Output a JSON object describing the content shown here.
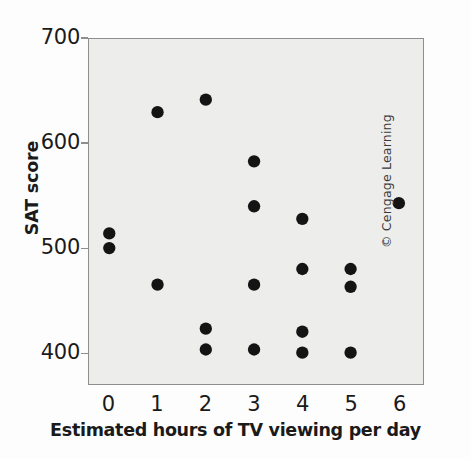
{
  "chart_data": {
    "type": "scatter",
    "title": "",
    "xlabel": "Estimated hours of TV viewing per day",
    "ylabel": "SAT score",
    "xlim": [
      -0.42,
      6.5
    ],
    "ylim": [
      370,
      700
    ],
    "xticks": [
      "0",
      "1",
      "2",
      "3",
      "4",
      "5",
      "6"
    ],
    "xtick_values": [
      0,
      1,
      2,
      3,
      4,
      5,
      6
    ],
    "yticks": [
      "700",
      "600",
      "500",
      "400"
    ],
    "ytick_values": [
      700,
      600,
      500,
      400
    ],
    "grid": false,
    "legend": null,
    "marker": "filled-circle",
    "marker_color": "#141414",
    "panel_color": "#ededeb",
    "points": [
      {
        "x": 0,
        "y": 514
      },
      {
        "x": 0,
        "y": 500
      },
      {
        "x": 1,
        "y": 630
      },
      {
        "x": 1,
        "y": 465
      },
      {
        "x": 2,
        "y": 642
      },
      {
        "x": 2,
        "y": 423
      },
      {
        "x": 2,
        "y": 403
      },
      {
        "x": 3,
        "y": 583
      },
      {
        "x": 3,
        "y": 540
      },
      {
        "x": 3,
        "y": 465
      },
      {
        "x": 3,
        "y": 403
      },
      {
        "x": 4,
        "y": 528
      },
      {
        "x": 4,
        "y": 480
      },
      {
        "x": 4,
        "y": 420
      },
      {
        "x": 4,
        "y": 400
      },
      {
        "x": 5,
        "y": 480
      },
      {
        "x": 5,
        "y": 463
      },
      {
        "x": 5,
        "y": 400
      },
      {
        "x": 6,
        "y": 543
      }
    ]
  },
  "credit": {
    "text": "© Cengage Learning"
  }
}
